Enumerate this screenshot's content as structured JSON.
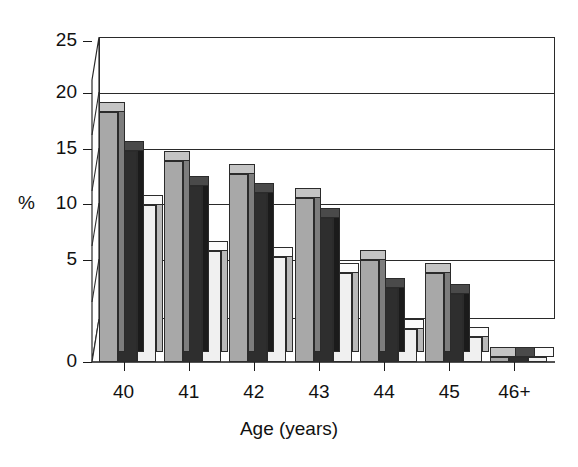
{
  "chart_data": {
    "type": "bar",
    "title": "",
    "subtitle": "",
    "xlabel": "Age (years)",
    "ylabel": "%",
    "categories": [
      "40",
      "41",
      "42",
      "43",
      "44",
      "45",
      "46+"
    ],
    "series": [
      {
        "name": "series-1",
        "color": "#a8a8a8",
        "values": [
          22.2,
          17.8,
          16.7,
          14.5,
          9.0,
          7.9,
          0.4
        ]
      },
      {
        "name": "series-2",
        "color": "#2e2e2e",
        "values": [
          18.7,
          15.6,
          15.0,
          12.8,
          6.6,
          6.0,
          0.4
        ]
      },
      {
        "name": "series-3",
        "color": "#f0f0f0",
        "values": [
          13.9,
          9.8,
          9.3,
          7.9,
          2.9,
          2.2,
          0.4
        ]
      }
    ],
    "ylim": [
      0,
      25
    ],
    "yticks": [
      0,
      5,
      10,
      15,
      20,
      25
    ],
    "ytick_labels": [
      "0",
      "5",
      "10",
      "15",
      "20",
      "25"
    ],
    "grid": true,
    "grid_axis": "y",
    "legend": false,
    "legend_position": "none",
    "style": "3d-grayscale-column",
    "bar_fill_colors": [
      "#a8a8a8",
      "#2e2e2e",
      "#f0f0f0"
    ],
    "axis_color": "#1a1a1a",
    "background": "#ffffff"
  },
  "axes": {
    "y_title": "%",
    "x_title": "Age (years)"
  }
}
